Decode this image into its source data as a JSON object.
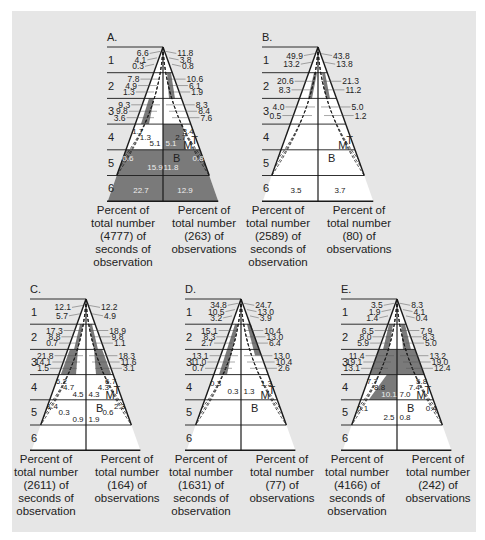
{
  "figure": {
    "colors": {
      "panel_bg": "#e6e6e6",
      "dark_fill": "#7a7a7a",
      "white": "#ffffff",
      "line": "#1a1a1a",
      "text": "#222222"
    },
    "zone_labels": [
      "1",
      "2",
      "3",
      "4",
      "5",
      "6"
    ],
    "curve_labels": {
      "top": "T",
      "middle": "M",
      "bottom": "B"
    },
    "caption_left_template": [
      "Percent of",
      "total number",
      "({n}) of",
      "seconds of",
      "observation"
    ],
    "caption_right_template": [
      "Percent of",
      "total number",
      "({n}) of",
      "observations"
    ]
  },
  "chart_data": [
    {
      "type": "diagram",
      "panel": "A.",
      "total_seconds": 4777,
      "total_observations": 263,
      "left_values": {
        "1": [
          6.6,
          4.1,
          0.3
        ],
        "2": [
          7.8,
          4.9,
          1.3
        ],
        "3": [
          9.3,
          9.8,
          3.6
        ],
        "4": [
          1.7,
          1.3,
          5.1
        ],
        "5": [
          0.6,
          15.9
        ],
        "6": [
          22.7
        ]
      },
      "right_values": {
        "1": [
          11.8,
          3.8,
          0.8
        ],
        "2": [
          10.6,
          6.1,
          1.9
        ],
        "3": [
          8.3,
          8.4,
          7.6
        ],
        "4": [
          3.4,
          2.7,
          5.1
        ],
        "5": [
          0.8,
          11.8
        ],
        "6": [
          12.9
        ]
      }
    },
    {
      "type": "diagram",
      "panel": "B.",
      "total_seconds": 2589,
      "total_observations": 80,
      "left_values": {
        "1": [
          49.9,
          13.2
        ],
        "2": [
          20.6,
          8.3
        ],
        "3": [
          4.0,
          0.5
        ],
        "6": [
          3.5
        ]
      },
      "right_values": {
        "1": [
          43.8,
          13.8
        ],
        "2": [
          21.3,
          11.2
        ],
        "3": [
          5.0,
          1.2
        ],
        "6": [
          3.7
        ]
      }
    },
    {
      "type": "diagram",
      "panel": "C.",
      "total_seconds": 2611,
      "total_observations": 164,
      "left_values": {
        "1": [
          12.1,
          5.7
        ],
        "2": [
          17.3,
          8.8,
          0.7
        ],
        "3": [
          21.8,
          14.1,
          1.5
        ],
        "4": [
          6.2,
          4.7,
          4.5
        ],
        "5": [
          1.4,
          0.3,
          0.9
        ]
      },
      "right_values": {
        "1": [
          12.2,
          4.9
        ],
        "2": [
          18.9,
          9.8,
          1.1
        ],
        "3": [
          18.3,
          11.6,
          3.1
        ],
        "4": [
          6.7,
          4.3,
          4.3
        ],
        "5": [
          2.3,
          0.6,
          1.9
        ]
      }
    },
    {
      "type": "diagram",
      "panel": "D.",
      "total_seconds": 1631,
      "total_observations": 77,
      "left_values": {
        "1": [
          34.8,
          10.5,
          3.2
        ],
        "2": [
          15.1,
          8.3,
          2.7
        ],
        "3": [
          13.1,
          11.0,
          0.7
        ],
        "4": [
          0.3,
          0.3
        ]
      },
      "right_values": {
        "1": [
          24.7,
          13.0,
          3.9
        ],
        "2": [
          10.4,
          13.0,
          6.4
        ],
        "3": [
          13.0,
          10.4,
          2.6
        ],
        "4": [
          1.3,
          1.3
        ]
      }
    },
    {
      "type": "diagram",
      "panel": "E.",
      "total_seconds": 4166,
      "total_observations": 242,
      "left_values": {
        "1": [
          3.5,
          1.9,
          1.4
        ],
        "2": [
          6.5,
          8.0,
          5.9
        ],
        "3": [
          11.4,
          19.1,
          13.1
        ],
        "4": [
          7.7,
          8.8,
          10.1
        ],
        "5": [
          0.1,
          2.5
        ]
      },
      "right_values": {
        "1": [
          8.3,
          4.1,
          0.4
        ],
        "2": [
          7.9,
          8.3,
          5.0
        ],
        "3": [
          13.2,
          19.0,
          12.4
        ],
        "4": [
          5.8,
          7.4,
          7.0
        ],
        "5": [
          0.4,
          0.8
        ]
      }
    }
  ],
  "captions": [
    {
      "left": [
        "Percent of",
        "total number",
        "(4777) of",
        "seconds of",
        "observation"
      ],
      "right": [
        "Percent of",
        "total number",
        "(263) of",
        "observations"
      ]
    },
    {
      "left": [
        "Percent of",
        "total number",
        "(2589) of",
        "seconds of",
        "observation"
      ],
      "right": [
        "Percent of",
        "total number",
        "(80) of",
        "observations"
      ]
    },
    {
      "left": [
        "Percent of",
        "total number",
        "(2611) of",
        "seconds of",
        "observation"
      ],
      "right": [
        "Percent of",
        "total number",
        "(164) of",
        "observations"
      ]
    },
    {
      "left": [
        "Percent of",
        "total number",
        "(1631) of",
        "seconds of",
        "observation"
      ],
      "right": [
        "Percent of",
        "total number",
        "(77) of",
        "observations"
      ]
    },
    {
      "left": [
        "Percent of",
        "total number",
        "(4166) of",
        "seconds of",
        "observation"
      ],
      "right": [
        "Percent of",
        "total number",
        "(242) of",
        "observations"
      ]
    }
  ]
}
